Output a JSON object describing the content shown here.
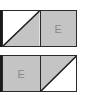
{
  "colors": {
    "gray": "#c4c4c4",
    "white": "#ffffff",
    "line": "#2a2a2a"
  },
  "rows": [
    {
      "cells": [
        {
          "type": "diagonal",
          "white": "upper-left",
          "label": ""
        },
        {
          "type": "solid",
          "label": "E"
        }
      ]
    },
    {
      "cells": [
        {
          "type": "solid",
          "label": "E"
        },
        {
          "type": "diagonal",
          "white": "lower-right",
          "label": ""
        }
      ]
    }
  ]
}
